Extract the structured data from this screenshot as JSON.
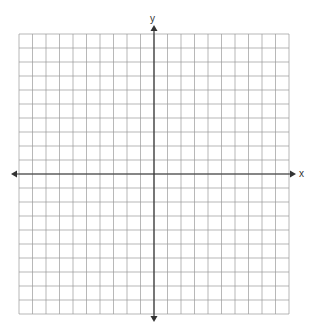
{
  "diagram": {
    "type": "coordinate-plane",
    "grid": {
      "left": 19,
      "top": 34,
      "right": 289,
      "bottom": 314,
      "cols": 20,
      "rows": 20,
      "line_color": "#9a9a9a",
      "line_width": 0.7
    },
    "axes": {
      "origin_px": {
        "x": 154,
        "y": 174
      },
      "color": "#333333",
      "width": 1.2,
      "x_axis": {
        "label": "x",
        "from": 11,
        "to": 296
      },
      "y_axis": {
        "label": "y",
        "from": 25,
        "to": 322
      }
    }
  }
}
